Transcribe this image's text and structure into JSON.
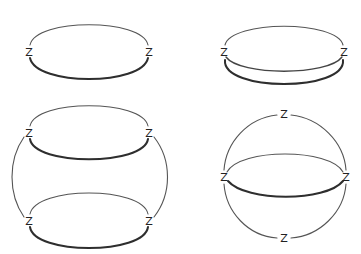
{
  "diagram": {
    "vertex_label": "Z",
    "colors": {
      "background": "#ffffff",
      "stroke": "#3a3a3a",
      "label": "#222222"
    },
    "figures": [
      {
        "id": "fig-top-left",
        "description": "Two Z vertices joined by two edges (thin upper arc, thick lower arc)",
        "vertices": [
          {
            "label": "Z",
            "x": 29,
            "y": 52
          },
          {
            "label": "Z",
            "x": 149,
            "y": 52
          }
        ],
        "edges": 2
      },
      {
        "id": "fig-top-right",
        "description": "Two Z vertices joined by three edges (upper arc, middle arc, thick lower arc)",
        "vertices": [
          {
            "label": "Z",
            "x": 224,
            "y": 52
          },
          {
            "label": "Z",
            "x": 344,
            "y": 52
          }
        ],
        "edges": 3
      },
      {
        "id": "fig-bottom-left",
        "description": "Four Z vertices: two pairs each joined by two arcs, pairs connected by large left and right arcs",
        "vertices": [
          {
            "label": "Z",
            "x": 29,
            "y": 133
          },
          {
            "label": "Z",
            "x": 149,
            "y": 133
          },
          {
            "label": "Z",
            "x": 29,
            "y": 221
          },
          {
            "label": "Z",
            "x": 149,
            "y": 221
          }
        ],
        "edges": 6
      },
      {
        "id": "fig-bottom-right",
        "description": "Four Z vertices on a circle (top, left, right, bottom) with equator drawn as two arcs between left and right",
        "vertices": [
          {
            "label": "Z",
            "x": 284,
            "y": 114
          },
          {
            "label": "Z",
            "x": 224,
            "y": 177
          },
          {
            "label": "Z",
            "x": 346,
            "y": 177
          },
          {
            "label": "Z",
            "x": 284,
            "y": 238
          }
        ],
        "edges": 6
      }
    ]
  }
}
